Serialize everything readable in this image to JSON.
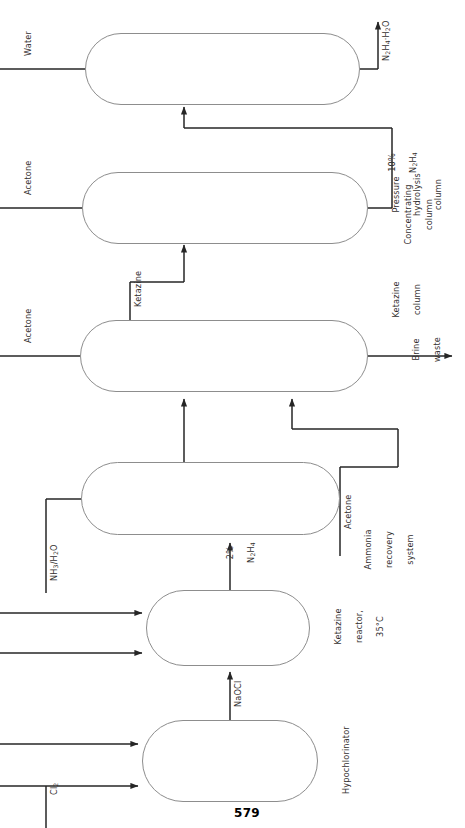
{
  "figure": {
    "page_number": "579",
    "orientation": "rotated-90-ccw"
  },
  "units": [
    {
      "id": "hypochlorinator",
      "label": "Hypochlorinator"
    },
    {
      "id": "ketazine-reactor",
      "label": "Ketazine\nreactor,\n35°C",
      "label_lines": [
        "Ketazine",
        "reactor,",
        "35°C"
      ]
    },
    {
      "id": "ammonia-recovery",
      "label": "Ammonia\nrecovery\nsystem",
      "label_lines": [
        "Ammonia",
        "recovery",
        "system"
      ]
    },
    {
      "id": "ketazine-column",
      "label": "Ketazine\ncolumn",
      "label_lines": [
        "Ketazine",
        "column"
      ]
    },
    {
      "id": "pressure-hydrolysis-column",
      "label": "Pressure\nhydrolysis\ncolumn",
      "label_lines": [
        "Pressure",
        "hydrolysis",
        "column"
      ]
    },
    {
      "id": "concentrating-column",
      "label": "Concentrating\ncolumn",
      "label_lines": [
        "Concentrating",
        "column"
      ]
    }
  ],
  "streams": {
    "chlorine": "Cl2",
    "chlorine_html": "Cl<sub>2</sub>",
    "ammonia_water": "NH3/H2O",
    "ammonia_water_html": "NH<sub>3</sub>/H<sub>2</sub>O",
    "sodium_hypochlorite": "NaOCl",
    "hydrazine_2pct_line1": "2%",
    "hydrazine_2pct_line2": "N2H4",
    "hydrazine_2pct_line2_html": "N<sub>2</sub>H<sub>4</sub>",
    "acetone_recycle": "Acetone",
    "acetone_ketazine_feed": "Acetone",
    "acetone_hydrolysis_feed": "Acetone",
    "brine_waste_line1": "Brine",
    "brine_waste_line2": "waste",
    "ketazine": "Ketazine",
    "hydrazine_10pct_line1": "10%",
    "hydrazine_10pct_line2": "N2H4",
    "hydrazine_10pct_line2_html": "N<sub>2</sub>H<sub>4</sub>",
    "water": "Water",
    "hydrazine_hydrate": "N2H4·H2O",
    "hydrazine_hydrate_html": "N<sub>2</sub>H<sub>4</sub>·H<sub>2</sub>O"
  },
  "colors": {
    "vessel_stroke": "#8d8d8d",
    "pipe_stroke": "#262626",
    "text": "#33302f",
    "background": "#ffffff"
  }
}
